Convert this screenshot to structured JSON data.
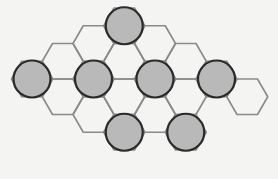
{
  "figure": {
    "width": 278,
    "height": 179,
    "colors": {
      "background": "#f4f4f2",
      "hex_stroke": "#8a8a8a",
      "node_fill": "#b9b9b9",
      "node_stroke": "#2a2a2a"
    },
    "grid": {
      "orientation": "flat-top",
      "hex_radius": 20.5,
      "origin_x": 32,
      "column_spacing": 30.75,
      "row_spacing": 35.5,
      "odd_column_offset": 17.75,
      "base_y": 79
    },
    "cells": [
      {
        "col": 0,
        "row": 0,
        "occupied": true
      },
      {
        "col": 1,
        "row": -1,
        "occupied": false
      },
      {
        "col": 1,
        "row": 0,
        "occupied": false
      },
      {
        "col": 2,
        "row": -1,
        "occupied": false
      },
      {
        "col": 2,
        "row": 0,
        "occupied": true
      },
      {
        "col": 2,
        "row": 1,
        "occupied": false
      },
      {
        "col": 3,
        "row": -2,
        "occupied": true
      },
      {
        "col": 3,
        "row": -1,
        "occupied": false
      },
      {
        "col": 3,
        "row": 0,
        "occupied": false
      },
      {
        "col": 3,
        "row": 1,
        "occupied": true
      },
      {
        "col": 4,
        "row": -1,
        "occupied": false
      },
      {
        "col": 4,
        "row": 0,
        "occupied": true
      },
      {
        "col": 4,
        "row": 1,
        "occupied": false
      },
      {
        "col": 5,
        "row": -1,
        "occupied": false
      },
      {
        "col": 5,
        "row": 0,
        "occupied": false
      },
      {
        "col": 5,
        "row": 1,
        "occupied": true
      },
      {
        "col": 6,
        "row": 0,
        "occupied": true
      },
      {
        "col": 7,
        "row": 0,
        "occupied": false
      }
    ],
    "node_radius": 18.5,
    "occupied_count": 7
  }
}
